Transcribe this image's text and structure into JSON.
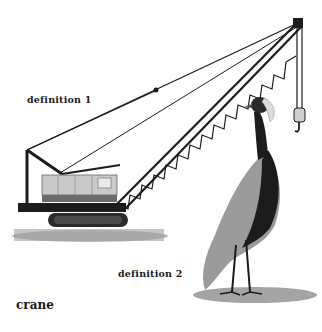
{
  "labels": {
    "definition_1": "definition 1",
    "definition_2": "definition 2",
    "word": "crane"
  },
  "illustrations": {
    "machine": "construction-crane",
    "bird": "crowned-crane-bird"
  },
  "colors": {
    "background": "#ffffff",
    "text": "#1a1a1a",
    "crane_body": "#b8b8b8",
    "dark": "#1c1c1c",
    "shadow": "#9a9a9a"
  }
}
